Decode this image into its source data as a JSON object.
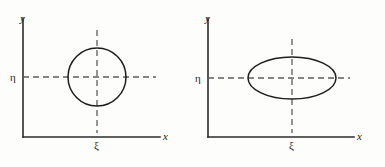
{
  "figure": {
    "background_color": "#fdfdfc",
    "ink_color": "#1d1d1d",
    "dash_color": "#5d5d5d",
    "width": 385,
    "height": 167
  },
  "panels": [
    {
      "id": "left",
      "shape": "circle",
      "axes": {
        "x_label": "x",
        "y_label": "y",
        "origin_x": 23,
        "origin_y": 137,
        "x_end": 160,
        "y_top": 18
      },
      "center_labels": {
        "x_center_label": "ξ",
        "y_center_label": "η"
      },
      "geometry": {
        "center_x": 97,
        "center_y": 77,
        "radius_x": 29,
        "radius_y": 29,
        "v_dash_top": 30,
        "v_dash_bottom": 133,
        "h_dash_left": 23,
        "h_dash_right": 156
      }
    },
    {
      "id": "right",
      "shape": "ellipse",
      "axes": {
        "x_label": "x",
        "y_label": "y",
        "origin_x": 16,
        "origin_y": 137,
        "x_end": 162,
        "y_top": 18
      },
      "center_labels": {
        "x_center_label": "ξ",
        "y_center_label": "η"
      },
      "geometry": {
        "center_x": 100,
        "center_y": 78,
        "radius_x": 44,
        "radius_y": 21,
        "v_dash_top": 39,
        "v_dash_bottom": 133,
        "h_dash_left": 16,
        "h_dash_right": 158
      }
    }
  ],
  "labels": {
    "left_y": "y",
    "left_x": "x",
    "left_xi": "ξ",
    "left_eta": "η",
    "right_y": "y",
    "right_x": "x",
    "right_xi": "ξ",
    "right_eta": "η"
  }
}
